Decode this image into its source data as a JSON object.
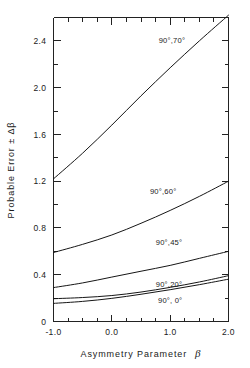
{
  "chart_data": {
    "type": "line",
    "title": "",
    "xlabel": "Asymmetry Parameter β",
    "ylabel": "Probable Error ± Δβ",
    "xlim": [
      -1.0,
      2.0
    ],
    "ylim": [
      0.0,
      2.6
    ],
    "grid": false,
    "legend_position": "inline-curve-labels",
    "xticks": [
      -1.0,
      0.0,
      1.0,
      2.0
    ],
    "xtick_labels": [
      "-1.0",
      "0.0",
      "1.0",
      "2.0"
    ],
    "x_minor_ticks": [
      -0.75,
      -0.5,
      -0.25,
      0.25,
      0.5,
      0.75,
      1.25,
      1.5,
      1.75
    ],
    "yticks": [
      0.0,
      0.4,
      0.8,
      1.2,
      1.6,
      2.0,
      2.4
    ],
    "ytick_labels": [
      "0",
      "0.4",
      "0.8",
      "1.2",
      "1.6",
      "2.0",
      "2.4"
    ],
    "y_minor_ticks": [
      0.2,
      0.6,
      1.0,
      1.4,
      1.8,
      2.2
    ],
    "x": [
      -1.0,
      -0.5,
      0.0,
      0.5,
      1.0,
      1.5,
      2.0
    ],
    "series": [
      {
        "name": "90°,70°",
        "label": "90°,70°",
        "values": [
          1.22,
          1.44,
          1.68,
          1.93,
          2.17,
          2.4,
          2.62
        ],
        "label_x": 1.03,
        "label_y": 2.38
      },
      {
        "name": "90°,60°",
        "label": "90°,60°",
        "values": [
          0.59,
          0.66,
          0.74,
          0.84,
          0.95,
          1.07,
          1.2
        ],
        "label_x": 0.88,
        "label_y": 1.09
      },
      {
        "name": "90°,45°",
        "label": "90°,45°",
        "values": [
          0.29,
          0.33,
          0.38,
          0.43,
          0.48,
          0.54,
          0.6
        ],
        "label_x": 0.98,
        "label_y": 0.655
      },
      {
        "name": "90°,20°",
        "label": "90°,20°",
        "values": [
          0.195,
          0.205,
          0.222,
          0.252,
          0.292,
          0.338,
          0.392
        ],
        "label_x": 0.98,
        "label_y": 0.295
      },
      {
        "name": "90°,0°",
        "label": "90°, 0°",
        "values": [
          0.155,
          0.172,
          0.198,
          0.233,
          0.272,
          0.315,
          0.362
        ],
        "label_x": 1.0,
        "label_y": 0.155
      }
    ],
    "colors": {
      "curve": "#161616",
      "axis": "#222222",
      "text": "#1a1a1a",
      "background": "#ffffff"
    }
  },
  "axis": {
    "x_title_text": "Asymmetry  Parameter",
    "x_title_symbol": "β",
    "y_title_text": "Probable  Error  ± Δβ"
  }
}
